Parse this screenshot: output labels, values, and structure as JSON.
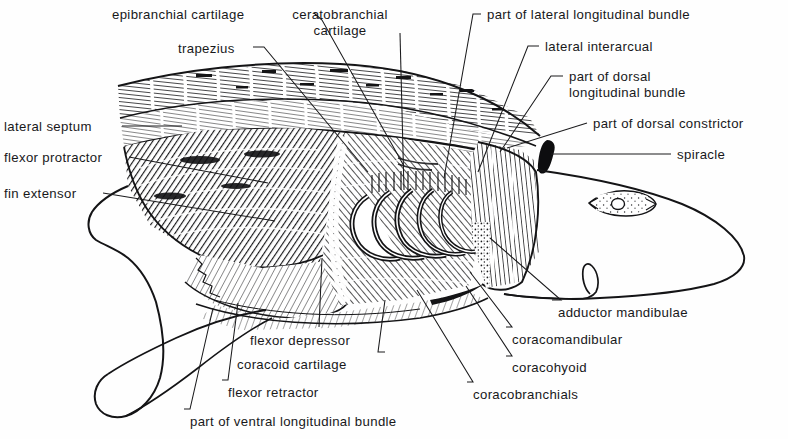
{
  "figure": {
    "kind": "anatomical-dissection-illustration",
    "style": "pen-and-ink engraving with hatching",
    "background_color": "#ffffff",
    "ink_color": "#1a1a1c",
    "width": 788,
    "height": 439
  },
  "labels": [
    {
      "id": "epibranchial-cartilage",
      "text": "epibranchial cartilage",
      "x": 112,
      "y": 7,
      "align": "left",
      "lines": [
        "epibranchial cartilage"
      ]
    },
    {
      "id": "ceratobranchial-cartilage",
      "text": "ceratobranchial cartilage",
      "x": 340,
      "y": 7,
      "align": "center",
      "lines": [
        "ceratobranchial",
        "cartilage"
      ]
    },
    {
      "id": "part-of-lateral-longitudinal-bundle",
      "text": "part of lateral longitudinal bundle",
      "x": 487,
      "y": 7,
      "align": "left",
      "lines": [
        "part of lateral longitudinal bundle"
      ]
    },
    {
      "id": "trapezius",
      "text": "trapezius",
      "x": 178,
      "y": 41,
      "align": "left",
      "lines": [
        "trapezius"
      ]
    },
    {
      "id": "lateral-interarcual",
      "text": "lateral interarcual",
      "x": 545,
      "y": 39,
      "align": "left",
      "lines": [
        "lateral interarcual"
      ]
    },
    {
      "id": "part-of-dorsal-longitudinal-bundle",
      "text": "part of dorsal longitudinal bundle",
      "x": 569,
      "y": 69,
      "align": "left",
      "lines": [
        "part of dorsal",
        "longitudinal bundle"
      ]
    },
    {
      "id": "part-of-dorsal-constrictor",
      "text": "part of dorsal constrictor",
      "x": 593,
      "y": 116,
      "align": "left",
      "lines": [
        "part of dorsal constrictor"
      ]
    },
    {
      "id": "lateral-septum",
      "text": "lateral septum",
      "x": 4,
      "y": 119,
      "align": "left",
      "lines": [
        "lateral septum"
      ]
    },
    {
      "id": "spiracle",
      "text": "spiracle",
      "x": 677,
      "y": 147,
      "align": "left",
      "lines": [
        "spiracle"
      ]
    },
    {
      "id": "flexor-protractor",
      "text": "flexor protractor",
      "x": 4,
      "y": 150,
      "align": "left",
      "lines": [
        "flexor protractor"
      ]
    },
    {
      "id": "fin-extensor",
      "text": "fin extensor",
      "x": 4,
      "y": 186,
      "align": "left",
      "lines": [
        "fin extensor"
      ]
    },
    {
      "id": "adductor-mandibulae",
      "text": "adductor mandibulae",
      "x": 558,
      "y": 305,
      "align": "left",
      "lines": [
        "adductor mandibulae"
      ]
    },
    {
      "id": "flexor-depressor",
      "text": "flexor depressor",
      "x": 250,
      "y": 333,
      "align": "left",
      "lines": [
        "flexor depressor"
      ]
    },
    {
      "id": "coracomandibular",
      "text": "coracomandibular",
      "x": 512,
      "y": 332,
      "align": "left",
      "lines": [
        "coracomandibular"
      ]
    },
    {
      "id": "coracoid-cartilage",
      "text": "coracoid cartilage",
      "x": 237,
      "y": 357,
      "align": "left",
      "lines": [
        "coracoid cartilage"
      ]
    },
    {
      "id": "coracohyoid",
      "text": "coracohyoid",
      "x": 512,
      "y": 360,
      "align": "left",
      "lines": [
        "coracohyoid"
      ]
    },
    {
      "id": "flexor-retractor",
      "text": "flexor retractor",
      "x": 228,
      "y": 385,
      "align": "left",
      "lines": [
        "flexor retractor"
      ]
    },
    {
      "id": "coracobranchials",
      "text": "coracobranchials",
      "x": 473,
      "y": 387,
      "align": "left",
      "lines": [
        "coracobranchials"
      ]
    },
    {
      "id": "part-of-ventral-longitudinal-bundle",
      "text": "part of ventral longitudinal bundle",
      "x": 190,
      "y": 414,
      "align": "left",
      "lines": [
        "part of ventral longitudinal bundle"
      ]
    }
  ],
  "leaders": [
    {
      "id": "leader-epibranchial-cartilage",
      "from": [
        314,
        13
      ],
      "to": [
        404,
        166
      ],
      "elbow": [
        322,
        20
      ]
    },
    {
      "id": "leader-ceratobranchial-cartilage",
      "from": [
        400,
        33
      ],
      "to": [
        404,
        190
      ],
      "elbow": null
    },
    {
      "id": "leader-part-of-lateral-longitudinal-bundle",
      "from": [
        481,
        14
      ],
      "to": [
        444,
        178
      ],
      "elbow": [
        473,
        14
      ]
    },
    {
      "id": "leader-trapezius",
      "from": [
        253,
        47
      ],
      "to": [
        368,
        172
      ],
      "elbow": [
        264,
        47
      ]
    },
    {
      "id": "leader-lateral-interarcual",
      "from": [
        539,
        46
      ],
      "to": [
        478,
        172
      ],
      "elbow": [
        528,
        46
      ]
    },
    {
      "id": "leader-part-of-dorsal-longitudinal-bundle",
      "from": [
        563,
        76
      ],
      "to": [
        500,
        152
      ],
      "elbow": [
        551,
        76
      ]
    },
    {
      "id": "leader-part-of-dorsal-constrictor",
      "from": [
        587,
        123
      ],
      "to": [
        507,
        148
      ],
      "elbow": null
    },
    {
      "id": "leader-lateral-septum",
      "from": [
        122,
        126
      ],
      "to": [
        182,
        126
      ],
      "elbow": null
    },
    {
      "id": "leader-spiracle",
      "from": [
        671,
        154
      ],
      "to": [
        551,
        154
      ],
      "elbow": null
    },
    {
      "id": "leader-flexor-protractor",
      "from": [
        129,
        157
      ],
      "to": [
        268,
        183
      ],
      "elbow": null
    },
    {
      "id": "leader-fin-extensor",
      "from": [
        103,
        193
      ],
      "to": [
        275,
        221
      ],
      "elbow": null
    },
    {
      "id": "leader-adductor-mandibulae",
      "from": [
        552,
        300
      ],
      "to": [
        490,
        238
      ],
      "elbow": [
        561,
        300
      ]
    },
    {
      "id": "leader-flexor-depressor",
      "from": [
        319,
        327
      ],
      "to": [
        322,
        258
      ],
      "elbow": null
    },
    {
      "id": "leader-coracomandibular",
      "from": [
        506,
        327
      ],
      "to": [
        470,
        272
      ],
      "elbow": [
        512,
        327
      ]
    },
    {
      "id": "leader-coracoid-cartilage",
      "from": [
        385,
        352
      ],
      "to": [
        385,
        300
      ],
      "elbow": [
        378,
        352
      ]
    },
    {
      "id": "leader-coracohyoid",
      "from": [
        506,
        356
      ],
      "to": [
        466,
        286
      ],
      "elbow": [
        512,
        356
      ]
    },
    {
      "id": "leader-flexor-retractor",
      "from": [
        222,
        380
      ],
      "to": [
        238,
        303
      ],
      "elbow": [
        228,
        380
      ]
    },
    {
      "id": "leader-coracobranchials",
      "from": [
        467,
        382
      ],
      "to": [
        417,
        290
      ],
      "elbow": [
        473,
        382
      ]
    },
    {
      "id": "leader-part-of-ventral-longitudinal-bundle",
      "from": [
        184,
        409
      ],
      "to": [
        213,
        308
      ],
      "elbow": [
        190,
        409
      ]
    }
  ],
  "anatomy_regions": [
    {
      "id": "dorsal-myomere-band",
      "name": "dorsal myomere band (lateral septum zone)",
      "hatch": "horizontal-wavy",
      "tone": "medium"
    },
    {
      "id": "trapezius-mass",
      "name": "trapezius muscle mass",
      "hatch": "diagonal-dense",
      "tone": "dark"
    },
    {
      "id": "flexor-protractor-mass",
      "name": "flexor protractor",
      "hatch": "diagonal",
      "tone": "medium-dark"
    },
    {
      "id": "fin-extensor-mass",
      "name": "fin extensor",
      "hatch": "diagonal-fine",
      "tone": "light"
    },
    {
      "id": "gill-arch-series",
      "name": "branchial arch series (5 nested arches)",
      "hatch": "stipple-outline",
      "tone": "mixed",
      "count": 5
    },
    {
      "id": "dorsal-constrictor",
      "name": "dorsal constrictor vertical fibers",
      "hatch": "vertical",
      "tone": "medium"
    },
    {
      "id": "spiracle-opening",
      "name": "spiracle",
      "hatch": "solid",
      "tone": "black"
    },
    {
      "id": "eye",
      "name": "eye with iris and pupil",
      "hatch": "stipple",
      "tone": "light"
    },
    {
      "id": "pectoral-fin",
      "name": "pectoral fin outline",
      "hatch": "none",
      "tone": "white"
    },
    {
      "id": "head-outline",
      "name": "head and snout outline",
      "hatch": "none",
      "tone": "white"
    },
    {
      "id": "ventral-longitudinal",
      "name": "ventral longitudinal bundle",
      "hatch": "diagonal-fine",
      "tone": "light"
    }
  ]
}
